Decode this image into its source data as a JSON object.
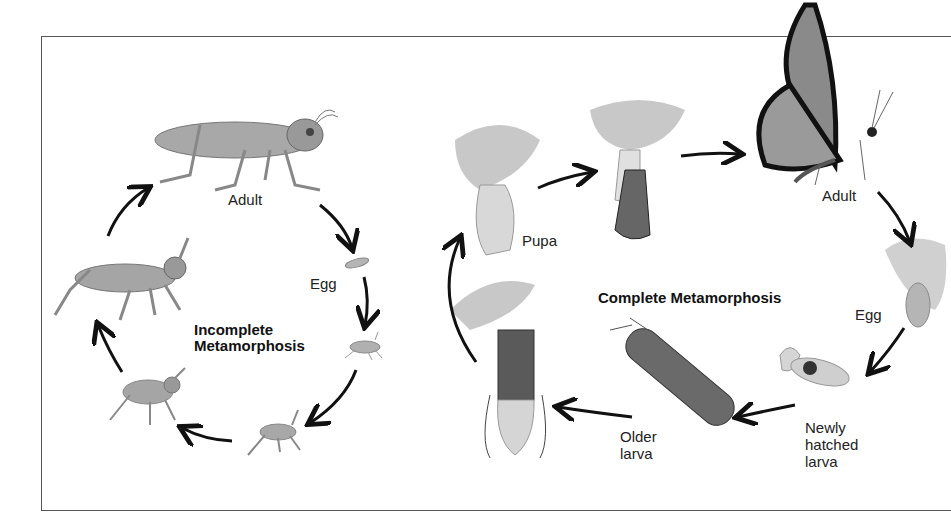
{
  "incomplete": {
    "title_line1": "Incomplete",
    "title_line2": "Metamorphosis",
    "stages": [
      {
        "key": "adult",
        "label": "Adult"
      },
      {
        "key": "egg",
        "label": "Egg"
      },
      {
        "key": "nymph1",
        "label": ""
      },
      {
        "key": "nymph2",
        "label": ""
      },
      {
        "key": "nymph3",
        "label": ""
      },
      {
        "key": "nymph4",
        "label": ""
      }
    ]
  },
  "complete": {
    "title": "Complete Metamorphosis",
    "stages": [
      {
        "key": "adult",
        "label": "Adult"
      },
      {
        "key": "egg",
        "label": "Egg"
      },
      {
        "key": "newly_hatched",
        "label_line1": "Newly",
        "label_line2": "hatched",
        "label_line3": "larva"
      },
      {
        "key": "older_larva",
        "label_line1": "Older",
        "label_line2": "larva"
      },
      {
        "key": "prepupa",
        "label": ""
      },
      {
        "key": "pupa",
        "label": "Pupa"
      },
      {
        "key": "emerging",
        "label": ""
      }
    ]
  },
  "colors": {
    "frame": "#555555",
    "arrow": "#111111",
    "insect": "#9a9a9a",
    "leaf": "#c8c8c8"
  }
}
